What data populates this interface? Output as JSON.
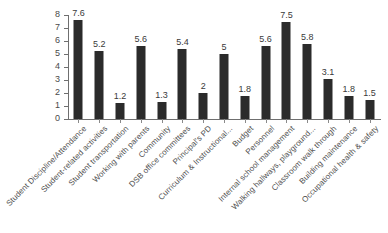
{
  "chart_data": {
    "type": "bar",
    "title": "",
    "subtitle": "",
    "xlabel": "",
    "ylabel": "",
    "ylim": [
      0,
      8
    ],
    "yticks": [
      0,
      1,
      2,
      3,
      4,
      5,
      6,
      7,
      8
    ],
    "grid": false,
    "legend": false,
    "orientation": "vertical",
    "bar_color": "#2b2b2b",
    "axis_color": "#6f6f6f",
    "categories": [
      "Student Discipline/Attendance",
      "Student-related activities",
      "Student transportation",
      "Working with parents",
      "Community",
      "DSB office committees",
      "Principal's PD",
      "Curriculum & Instructional...",
      "Budget",
      "Personnel",
      "Internal school management",
      "Walking hallways, playground...",
      "Classroom walk through",
      "Building maintenance",
      "Occupational health & safety"
    ],
    "values": [
      7.6,
      5.2,
      1.2,
      5.6,
      1.3,
      5.4,
      2,
      5,
      1.8,
      5.6,
      7.5,
      5.8,
      3.1,
      1.8,
      1.5
    ],
    "value_labels": [
      "7.6",
      "5.2",
      "1.2",
      "5.6",
      "1.3",
      "5.4",
      "2",
      "5",
      "1.8",
      "5.6",
      "7.5",
      "5.8",
      "3.1",
      "1.8",
      "1.5"
    ]
  }
}
